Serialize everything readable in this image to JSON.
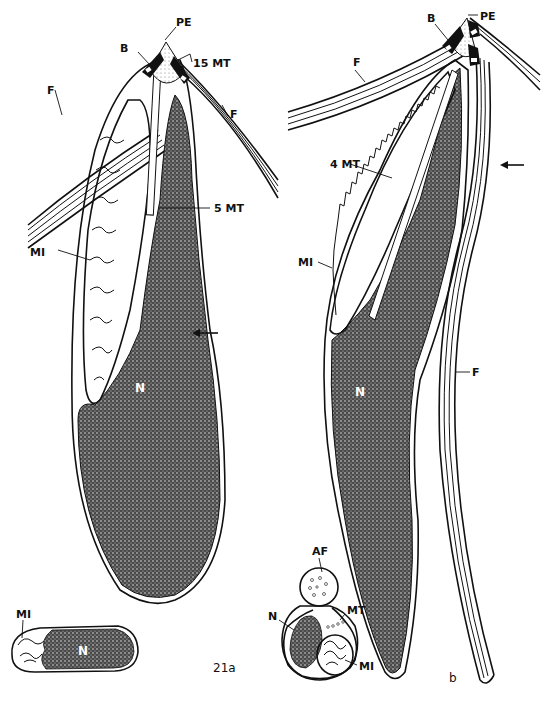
{
  "figure": {
    "panels": [
      {
        "id": "21a",
        "label": "21a",
        "annotations": {
          "pe": "PE",
          "b": "B",
          "mt15": "15 MT",
          "f_left": "F",
          "f_right": "F",
          "mt5": "5 MT",
          "mi": "MI",
          "n": "N",
          "section_mi": "MI",
          "section_n": "N"
        }
      },
      {
        "id": "b",
        "label": "b",
        "annotations": {
          "pe": "PE",
          "b": "B",
          "f_top": "F",
          "mt4": "4 MT",
          "mi": "MI",
          "n": "N",
          "f_flagellum": "F",
          "section_af": "AF",
          "section_n": "N",
          "section_mt": "MT",
          "section_mi": "MI"
        }
      }
    ]
  },
  "colors": {
    "ink": "#111111",
    "paper": "#ffffff",
    "stipple": "#555555"
  }
}
